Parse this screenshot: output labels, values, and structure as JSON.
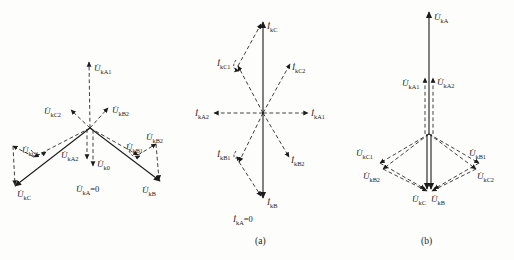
{
  "figure": {
    "left": {
      "UkA1": {
        "m": "U̇",
        "s": "kA1"
      },
      "UkC2": {
        "m": "U̇",
        "s": "kC2"
      },
      "UkB2_inner": {
        "m": "U̇",
        "s": "kB2"
      },
      "UkA2": {
        "m": "U̇",
        "s": "kA2"
      },
      "Uk0": {
        "m": "U̇",
        "s": "k0"
      },
      "UkC1": {
        "m": "U̇",
        "s": "kC1"
      },
      "UkB1": {
        "m": "U̇",
        "s": "kB1"
      },
      "UkB2_outer": {
        "m": "U̇",
        "s": "kB2"
      },
      "UkC": {
        "m": "U̇",
        "s": "kC"
      },
      "UkB": {
        "m": "U̇",
        "s": "kB"
      },
      "UkA_zero": {
        "m": "U̇",
        "s": "kA",
        "eq": "=0"
      }
    },
    "middle": {
      "IkC": {
        "m": "İ",
        "s": "kC"
      },
      "IkC1": {
        "m": "İ",
        "s": "kC1"
      },
      "IkC2": {
        "m": "İ",
        "s": "kC2"
      },
      "IkA1": {
        "m": "İ",
        "s": "kA1"
      },
      "IkA2": {
        "m": "İ",
        "s": "kA2"
      },
      "IkB1": {
        "m": "İ",
        "s": "kB1"
      },
      "IkB2": {
        "m": "İ",
        "s": "kB2"
      },
      "IkB": {
        "m": "İ",
        "s": "kB"
      },
      "IkA_zero": {
        "m": "İ",
        "s": "kA",
        "eq": "=0"
      },
      "caption": "(a)"
    },
    "right": {
      "UkA": {
        "m": "U̇",
        "s": "kA"
      },
      "UkA1": {
        "m": "U̇",
        "s": "kA1"
      },
      "UkA2": {
        "m": "U̇",
        "s": "kA2"
      },
      "UkC1": {
        "m": "U̇",
        "s": "kC1"
      },
      "UkB2": {
        "m": "U̇",
        "s": "kB2"
      },
      "UkB1": {
        "m": "U̇",
        "s": "kB1"
      },
      "UkC2": {
        "m": "U̇",
        "s": "kC2"
      },
      "UkC": {
        "m": "U̇",
        "s": "kC"
      },
      "UkB": {
        "m": "U̇",
        "s": "kB"
      },
      "caption": "(b)"
    }
  }
}
